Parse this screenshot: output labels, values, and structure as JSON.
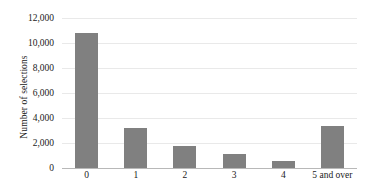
{
  "chart_data": {
    "type": "bar",
    "title": "",
    "xlabel": "",
    "ylabel": "Number of selections",
    "categories": [
      "0",
      "1",
      "2",
      "3",
      "4",
      "5 and over"
    ],
    "values": [
      10840,
      3200,
      1800,
      1150,
      600,
      3350
    ],
    "series": [
      {
        "name": "Number of selections",
        "values": [
          10840,
          3200,
          1800,
          1150,
          600,
          3350
        ]
      }
    ],
    "ylim": [
      0,
      12000
    ],
    "ytick_values": [
      0,
      2000,
      4000,
      6000,
      8000,
      10000,
      12000
    ],
    "ytick_labels": [
      "0",
      "2,000",
      "4,000",
      "6,000",
      "8,000",
      "10,000",
      "12,000"
    ],
    "grid": true,
    "legend": false,
    "bar_color": "#808080",
    "gridline_color": "#e9e9e9",
    "axis_color": "#b8b8b8"
  }
}
